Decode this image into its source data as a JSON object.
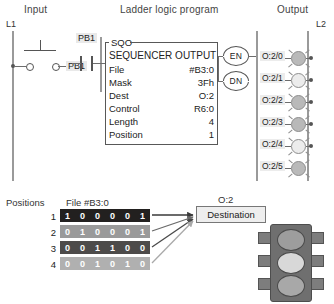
{
  "headers": {
    "input": "Input",
    "ladder": "Ladder logic program",
    "output": "Output"
  },
  "rails": {
    "left_label": "L1",
    "right_label": "L2"
  },
  "input_section": {
    "pushbutton_label": "PB1"
  },
  "rung": {
    "contact_label": "PB1"
  },
  "instruction_block": {
    "mnemonic": "SQO",
    "title": "SEQUENCER OUTPUT",
    "rows": [
      {
        "label": "File",
        "value": "#B3:0"
      },
      {
        "label": "Mask",
        "value": "3Fh"
      },
      {
        "label": "Dest",
        "value": "O:2"
      },
      {
        "label": "Control",
        "value": "R6:0"
      },
      {
        "label": "Length",
        "value": "4"
      },
      {
        "label": "Position",
        "value": "1"
      }
    ],
    "bubbles": [
      {
        "label": "EN"
      },
      {
        "label": "DN"
      }
    ]
  },
  "outputs": [
    {
      "address": "O:2/0",
      "state": "on"
    },
    {
      "address": "O:2/1",
      "state": "off"
    },
    {
      "address": "O:2/2",
      "state": "on"
    },
    {
      "address": "O:2/3",
      "state": "on"
    },
    {
      "address": "O:2/4",
      "state": "off"
    },
    {
      "address": "O:2/5",
      "state": "on"
    }
  ],
  "file_table": {
    "positions_label": "Positions",
    "file_label": "File #B3:0",
    "rows": [
      {
        "index": "1",
        "bits": [
          "1",
          "0",
          "0",
          "0",
          "0",
          "1"
        ]
      },
      {
        "index": "2",
        "bits": [
          "0",
          "1",
          "0",
          "0",
          "0",
          "1"
        ]
      },
      {
        "index": "3",
        "bits": [
          "0",
          "0",
          "1",
          "1",
          "0",
          "0"
        ]
      },
      {
        "index": "4",
        "bits": [
          "0",
          "0",
          "1",
          "0",
          "1",
          "0"
        ]
      }
    ],
    "row_colors": [
      "#22201f",
      "#9a9a9a",
      "#4d4b4a",
      "#b0b0b0"
    ]
  },
  "destination": {
    "address": "O:2",
    "label": "Destination"
  },
  "traffic_light": {
    "lenses": [
      {
        "name": "red-lens",
        "color": "#9d9d9d"
      },
      {
        "name": "yellow-lens",
        "color": "#d8d8d8"
      },
      {
        "name": "green-lens",
        "color": "#a8a8a8"
      }
    ]
  },
  "colors": {
    "rail": "#9a9a9a",
    "wire": "#6d6d6d",
    "lamp_on": "#b9b9b9",
    "lamp_off": "#ececec"
  }
}
